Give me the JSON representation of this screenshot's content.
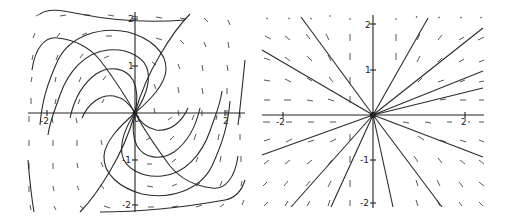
{
  "figure": {
    "panels": [
      {
        "name": "spiral-node-portrait",
        "origin_px": [
          135,
          113
        ],
        "unit_px": [
          45,
          47
        ],
        "bounds_px": {
          "x0": 28,
          "y0": 12,
          "x1": 245,
          "y1": 210
        },
        "tick_labels": {
          "x_neg": "-2",
          "x_pos": "2",
          "y_pos2": "2",
          "y_pos1": "1",
          "y_neg1": "-1",
          "y_neg2": "-2",
          "origin": "0"
        },
        "curves": [
          "M135,113 C150,100 165,85 166,70 C167,52 150,38 128,32 C100,26 70,36 58,60 C48,82 42,100 40,125",
          "M135,113 C145,98 150,85 148,72 C146,58 128,48 108,50 C85,52 68,72 60,95 C55,110 50,120 48,135",
          "M135,113 C138,100 138,90 133,80 C126,68 110,65 96,74 C82,84 74,100 70,118",
          "M135,113 C130,104 124,98 114,96 C100,94 88,104 82,118",
          "M135,113 C140,95 148,75 160,55 C170,38 180,24 190,14",
          "M135,113 C125,95 115,80 100,60 C90,48 75,40 58,38 C45,36 35,48 32,70",
          "M135,113 C120,126 105,141 104,156 C103,174 120,188 142,194 C170,200 200,190 212,166 C222,144 228,126 230,101",
          "M135,113 C125,128 120,141 122,154 C124,168 142,178 162,176 C185,174 202,154 210,131 C215,116 220,106 222,91",
          "M135,113 C132,126 132,136 137,146 C144,158 160,161 174,152 C188,142 196,126 200,108",
          "M135,113 C140,122 146,128 156,130 C170,132 182,122 188,108",
          "M135,113 C130,131 122,151 110,171 C100,188 90,202 80,212",
          "M135,113 C145,131 155,146 170,166 C180,178 195,186 212,188 C225,190 235,178 238,156",
          "M40,14 C48,8 60,10 80,14 C120,22 160,22 185,20",
          "M245,60 C242,90 240,110 238,125",
          "M28,160 C30,185 32,200 34,212",
          "M100,212 C140,212 180,208 225,200 C235,198 242,190 245,180"
        ],
        "field_segments": [
          [
            36,
            16,
            40,
            14
          ],
          [
            60,
            16,
            66,
            15
          ],
          [
            84,
            15,
            90,
            15
          ],
          [
            108,
            15,
            114,
            16
          ],
          [
            132,
            16,
            138,
            17
          ],
          [
            156,
            17,
            162,
            18
          ],
          [
            180,
            18,
            186,
            19
          ],
          [
            204,
            18,
            208,
            22
          ],
          [
            228,
            20,
            230,
            25
          ],
          [
            33,
            38,
            35,
            33
          ],
          [
            57,
            37,
            60,
            33
          ],
          [
            82,
            35,
            87,
            33
          ],
          [
            106,
            36,
            112,
            36
          ],
          [
            156,
            38,
            162,
            40
          ],
          [
            180,
            40,
            184,
            44
          ],
          [
            204,
            42,
            206,
            47
          ],
          [
            228,
            42,
            229,
            48
          ],
          [
            32,
            60,
            33,
            55
          ],
          [
            56,
            60,
            58,
            55
          ],
          [
            80,
            58,
            83,
            54
          ],
          [
            104,
            58,
            109,
            56
          ],
          [
            152,
            62,
            156,
            65
          ],
          [
            178,
            64,
            180,
            69
          ],
          [
            202,
            65,
            203,
            71
          ],
          [
            227,
            65,
            228,
            71
          ],
          [
            31,
            82,
            32,
            77
          ],
          [
            55,
            82,
            56,
            77
          ],
          [
            79,
            82,
            81,
            77
          ],
          [
            103,
            80,
            106,
            76
          ],
          [
            154,
            84,
            156,
            89
          ],
          [
            178,
            87,
            179,
            93
          ],
          [
            202,
            88,
            203,
            94
          ],
          [
            227,
            88,
            227,
            94
          ],
          [
            31,
            104,
            31,
            98
          ],
          [
            55,
            104,
            56,
            99
          ],
          [
            78,
            104,
            80,
            99
          ],
          [
            102,
            103,
            104,
            99
          ],
          [
            154,
            108,
            155,
            113
          ],
          [
            178,
            110,
            179,
            116
          ],
          [
            202,
            110,
            202,
            116
          ],
          [
            227,
            110,
            227,
            116
          ],
          [
            29,
            116,
            29,
            122
          ],
          [
            52,
            118,
            53,
            123
          ],
          [
            76,
            118,
            77,
            123
          ],
          [
            168,
            120,
            172,
            117
          ],
          [
            192,
            120,
            194,
            115
          ],
          [
            216,
            120,
            217,
            115
          ],
          [
            240,
            118,
            240,
            113
          ],
          [
            29,
            140,
            29,
            146
          ],
          [
            53,
            140,
            53,
            146
          ],
          [
            77,
            140,
            77,
            146
          ],
          [
            101,
            140,
            102,
            145
          ],
          [
            146,
            140,
            150,
            138
          ],
          [
            170,
            140,
            174,
            136
          ],
          [
            194,
            140,
            196,
            134
          ],
          [
            218,
            140,
            219,
            134
          ],
          [
            240,
            140,
            240,
            134
          ],
          [
            29,
            163,
            29,
            169
          ],
          [
            53,
            163,
            53,
            169
          ],
          [
            77,
            163,
            78,
            168
          ],
          [
            101,
            162,
            103,
            167
          ],
          [
            147,
            164,
            152,
            164
          ],
          [
            172,
            162,
            176,
            159
          ],
          [
            196,
            162,
            198,
            157
          ],
          [
            220,
            162,
            221,
            156
          ],
          [
            241,
            162,
            241,
            156
          ],
          [
            29,
            186,
            29,
            192
          ],
          [
            53,
            186,
            54,
            191
          ],
          [
            77,
            186,
            79,
            190
          ],
          [
            101,
            185,
            104,
            189
          ],
          [
            147,
            186,
            153,
            187
          ],
          [
            172,
            186,
            177,
            184
          ],
          [
            196,
            186,
            200,
            183
          ],
          [
            220,
            186,
            222,
            181
          ],
          [
            241,
            186,
            242,
            181
          ],
          [
            30,
            205,
            31,
            210
          ],
          [
            54,
            206,
            56,
            210
          ],
          [
            80,
            206,
            84,
            209
          ],
          [
            104,
            206,
            110,
            208
          ],
          [
            148,
            207,
            154,
            207
          ],
          [
            172,
            207,
            178,
            206
          ],
          [
            196,
            207,
            202,
            205
          ],
          [
            220,
            207,
            224,
            204
          ],
          [
            242,
            205,
            244,
            200
          ]
        ]
      },
      {
        "name": "star-node-portrait",
        "origin_px": [
          373,
          115
        ],
        "unit_px": [
          46,
          45
        ],
        "bounds_px": {
          "x0": 262,
          "y0": 15,
          "x1": 484,
          "y1": 207
        },
        "tick_labels": {
          "x_neg": "-2",
          "x_pos": "2",
          "y_pos2": "2",
          "y_pos1": "1",
          "y_neg1": "-1",
          "y_neg2": "-2"
        },
        "ray_endpoints": [
          [
            301,
            17
          ],
          [
            262,
            50
          ],
          [
            428,
            18
          ],
          [
            483,
            28
          ],
          [
            483,
            71
          ],
          [
            483,
            88
          ],
          [
            262,
            155
          ],
          [
            291,
            207
          ],
          [
            331,
            207
          ],
          [
            393,
            207
          ],
          [
            442,
            207
          ],
          [
            483,
            157
          ]
        ],
        "field_segments": [
          [
            266,
            18,
            268,
            19
          ],
          [
            288,
            18,
            290,
            19
          ],
          [
            310,
            18,
            312,
            19
          ],
          [
            330,
            15,
            330,
            17
          ],
          [
            350,
            18,
            350,
            20
          ],
          [
            396,
            18,
            396,
            20
          ],
          [
            416,
            18,
            417,
            16
          ],
          [
            438,
            18,
            440,
            17
          ],
          [
            460,
            18,
            462,
            17
          ],
          [
            480,
            18,
            482,
            17
          ],
          [
            265,
            36,
            271,
            39
          ],
          [
            285,
            36,
            290,
            40
          ],
          [
            306,
            34,
            310,
            39
          ],
          [
            326,
            34,
            329,
            40
          ],
          [
            350,
            34,
            350,
            41
          ],
          [
            396,
            34,
            396,
            41
          ],
          [
            417,
            40,
            420,
            34
          ],
          [
            438,
            40,
            442,
            35
          ],
          [
            459,
            40,
            464,
            37
          ],
          [
            478,
            40,
            484,
            37
          ],
          [
            264,
            58,
            270,
            60
          ],
          [
            285,
            57,
            290,
            61
          ],
          [
            307,
            56,
            312,
            61
          ],
          [
            328,
            55,
            331,
            61
          ],
          [
            350,
            53,
            350,
            60
          ],
          [
            396,
            53,
            396,
            60
          ],
          [
            417,
            62,
            420,
            56
          ],
          [
            438,
            62,
            442,
            58
          ],
          [
            459,
            62,
            464,
            59
          ],
          [
            479,
            62,
            484,
            60
          ],
          [
            264,
            80,
            270,
            81
          ],
          [
            285,
            79,
            291,
            82
          ],
          [
            307,
            78,
            312,
            81
          ],
          [
            329,
            77,
            333,
            82
          ],
          [
            350,
            77,
            350,
            84
          ],
          [
            418,
            82,
            422,
            78
          ],
          [
            438,
            82,
            444,
            80
          ],
          [
            460,
            82,
            465,
            80
          ],
          [
            479,
            82,
            484,
            81
          ],
          [
            264,
            100,
            270,
            100
          ],
          [
            284,
            100,
            291,
            100
          ],
          [
            307,
            100,
            313,
            101
          ],
          [
            328,
            99,
            334,
            101
          ],
          [
            350,
            96,
            350,
            103
          ],
          [
            440,
            100,
            446,
            99
          ],
          [
            460,
            100,
            466,
            100
          ],
          [
            479,
            100,
            484,
            100
          ],
          [
            263,
            122,
            270,
            122
          ],
          [
            286,
            122,
            292,
            122
          ],
          [
            308,
            122,
            314,
            122
          ],
          [
            330,
            122,
            336,
            122
          ],
          [
            403,
            122,
            409,
            123
          ],
          [
            425,
            122,
            431,
            123
          ],
          [
            447,
            122,
            452,
            122
          ],
          [
            468,
            122,
            470,
            122
          ],
          [
            479,
            122,
            484,
            122
          ],
          [
            264,
            141,
            270,
            139
          ],
          [
            286,
            142,
            292,
            139
          ],
          [
            308,
            142,
            314,
            140
          ],
          [
            330,
            142,
            336,
            139
          ],
          [
            350,
            134,
            350,
            141
          ],
          [
            418,
            136,
            424,
            140
          ],
          [
            440,
            140,
            446,
            142
          ],
          [
            460,
            140,
            466,
            142
          ],
          [
            479,
            140,
            484,
            142
          ],
          [
            264,
            164,
            269,
            160
          ],
          [
            285,
            164,
            290,
            160
          ],
          [
            307,
            164,
            312,
            160
          ],
          [
            328,
            165,
            332,
            160
          ],
          [
            350,
            156,
            350,
            163
          ],
          [
            414,
            156,
            418,
            162
          ],
          [
            438,
            158,
            442,
            163
          ],
          [
            460,
            160,
            465,
            164
          ],
          [
            479,
            160,
            484,
            164
          ],
          [
            263,
            186,
            267,
            182
          ],
          [
            284,
            186,
            288,
            181
          ],
          [
            306,
            186,
            310,
            181
          ],
          [
            328,
            187,
            331,
            181
          ],
          [
            350,
            180,
            350,
            187
          ],
          [
            416,
            180,
            418,
            186
          ],
          [
            437,
            180,
            440,
            186
          ],
          [
            459,
            182,
            463,
            187
          ],
          [
            479,
            182,
            484,
            186
          ],
          [
            264,
            206,
            268,
            202
          ],
          [
            285,
            206,
            288,
            201
          ],
          [
            307,
            206,
            310,
            201
          ],
          [
            328,
            206,
            330,
            200
          ],
          [
            350,
            200,
            350,
            206
          ],
          [
            416,
            200,
            418,
            206
          ],
          [
            437,
            200,
            440,
            206
          ],
          [
            459,
            202,
            462,
            206
          ],
          [
            479,
            202,
            483,
            206
          ]
        ]
      }
    ]
  }
}
